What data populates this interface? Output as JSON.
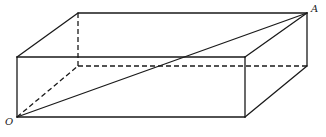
{
  "diagram": {
    "type": "rectangular-box-3d",
    "vertices": {
      "O": [
        17,
        117
      ],
      "front_bottom_right": [
        245,
        117
      ],
      "front_top_left": [
        17,
        57
      ],
      "front_top_right": [
        245,
        57
      ],
      "back_top_left": [
        78,
        13
      ],
      "A": [
        307,
        13
      ],
      "back_bottom_right": [
        307,
        66
      ],
      "back_bottom_left_hidden": [
        78,
        66
      ]
    },
    "labels": {
      "origin": "O",
      "opposite_corner": "A"
    },
    "colors": {
      "stroke": "#1a1a1a",
      "background": "#ffffff"
    }
  }
}
